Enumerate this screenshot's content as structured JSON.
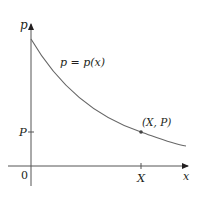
{
  "figure": {
    "type": "demand-curve-diagram",
    "y_axis_label": "p",
    "x_axis_label": "x",
    "origin_label": "0",
    "curve_label": "p = p(x)",
    "point_label": "(X, P)",
    "y_tick_label": "P",
    "x_tick_label": "X",
    "colors": {
      "axis": "#231f20",
      "curve": "#555555",
      "point": "#444444"
    }
  }
}
